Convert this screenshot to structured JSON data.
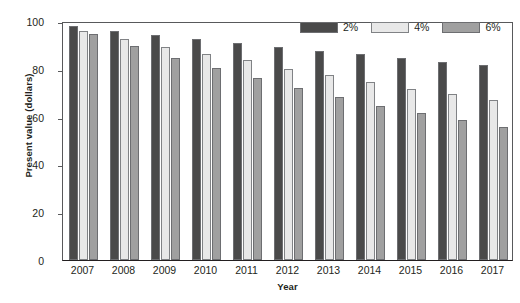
{
  "chart_data": {
    "type": "bar",
    "title": "",
    "subtitle": "",
    "xlabel": "Year",
    "ylabel": "Present value (dollars)",
    "categories": [
      "2007",
      "2008",
      "2009",
      "2010",
      "2011",
      "2012",
      "2013",
      "2014",
      "2015",
      "2016",
      "2017"
    ],
    "series": [
      {
        "name": "2%",
        "color": "#4a4a4a",
        "values": [
          98.0,
          96.0,
          94.2,
          92.5,
          91.0,
          89.0,
          87.3,
          86.0,
          84.6,
          83.0,
          81.5
        ]
      },
      {
        "name": "4%",
        "color": "#e8e8e8",
        "values": [
          96.0,
          92.6,
          89.2,
          86.0,
          83.5,
          80.0,
          77.5,
          74.6,
          71.6,
          69.3,
          67.0
        ]
      },
      {
        "name": "6%",
        "color": "#a0a0a0",
        "values": [
          94.4,
          89.4,
          84.6,
          80.2,
          76.0,
          72.0,
          68.2,
          64.5,
          61.4,
          58.4,
          55.5
        ]
      }
    ],
    "ylim": [
      0,
      100
    ],
    "yticks": [
      0,
      20,
      40,
      60,
      80,
      100
    ],
    "grid": false,
    "legend_position": "top-right",
    "legend_entries": [
      "2%",
      "4%",
      "6%"
    ]
  },
  "axis_colors": {
    "frame": "#58595b",
    "baseline": "#231f20",
    "text": "#231f20"
  }
}
